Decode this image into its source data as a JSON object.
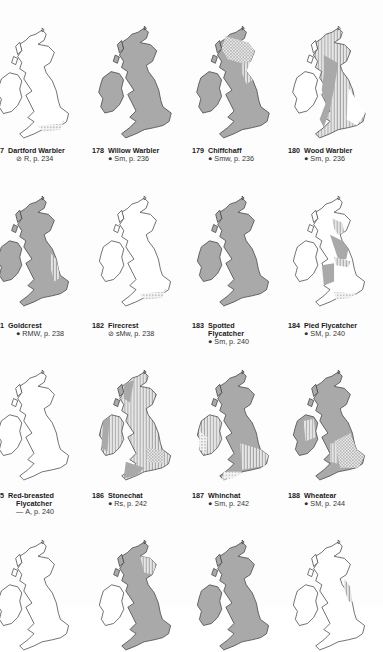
{
  "colors": {
    "land_fill": "#a9a9a9",
    "land_empty": "#ffffff",
    "coast": "#3a3a3a",
    "hatch": "#c8c8c8",
    "text": "#1a1a1a"
  },
  "species": [
    {
      "num": "7",
      "name": "Dartford Warbler",
      "name2": "",
      "symbol": "⊘",
      "status": "R, p. 234"
    },
    {
      "num": "178",
      "name": "Willow Warbler",
      "name2": "",
      "symbol": "●",
      "status": "Sm, p. 236"
    },
    {
      "num": "179",
      "name": "Chiffchaff",
      "name2": "",
      "symbol": "●",
      "status": "Smw, p. 236"
    },
    {
      "num": "180",
      "name": "Wood Warbler",
      "name2": "",
      "symbol": "●",
      "status": "Sm, p. 236"
    },
    {
      "num": "1",
      "name": "Goldcrest",
      "name2": "",
      "symbol": "●",
      "status": "RMW, p. 238"
    },
    {
      "num": "182",
      "name": "Firecrest",
      "name2": "",
      "symbol": "⊘",
      "status": "sMw, p. 238"
    },
    {
      "num": "183",
      "name": "Spotted",
      "name2": "Flycatcher",
      "symbol": "●",
      "status": "Sm, p. 240"
    },
    {
      "num": "184",
      "name": "Pied Flycatcher",
      "name2": "",
      "symbol": "●",
      "status": "SM, p. 240"
    },
    {
      "num": "5",
      "name": "Red-breasted",
      "name2": "Flycatcher",
      "symbol": "—",
      "status": "A, p. 240"
    },
    {
      "num": "186",
      "name": "Stonechat",
      "name2": "",
      "symbol": "●",
      "status": "Rs, p. 242"
    },
    {
      "num": "187",
      "name": "Whinchat",
      "name2": "",
      "symbol": "●",
      "status": "Sm, p. 242"
    },
    {
      "num": "188",
      "name": "Wheatear",
      "name2": "",
      "symbol": "●",
      "status": "SM, p. 244"
    }
  ],
  "maps": [
    {
      "id": "dartford-warbler",
      "gb": "empty",
      "ireland": "empty",
      "overlay": "south-hatch"
    },
    {
      "id": "willow-warbler",
      "gb": "full",
      "ireland": "full",
      "overlay": "none"
    },
    {
      "id": "chiffchaff",
      "gb": "full",
      "ireland": "full",
      "overlay": "north-hatch"
    },
    {
      "id": "wood-warbler",
      "gb": "partial",
      "ireland": "empty",
      "overlay": "mixed-hatch"
    },
    {
      "id": "goldcrest",
      "gb": "full",
      "ireland": "full",
      "overlay": "east-hatch"
    },
    {
      "id": "firecrest",
      "gb": "empty",
      "ireland": "empty",
      "overlay": "south-dots"
    },
    {
      "id": "spotted-flycatcher",
      "gb": "full",
      "ireland": "full",
      "overlay": "none"
    },
    {
      "id": "pied-flycatcher",
      "gb": "partial",
      "ireland": "empty",
      "overlay": "mixed-hatch"
    },
    {
      "id": "red-breasted-flycatcher",
      "gb": "empty",
      "ireland": "empty",
      "overlay": "none"
    },
    {
      "id": "stonechat",
      "gb": "partial",
      "ireland": "partial",
      "overlay": "mixed-hatch"
    },
    {
      "id": "whinchat",
      "gb": "full",
      "ireland": "hatch",
      "overlay": "south-hatch"
    },
    {
      "id": "wheatear",
      "gb": "full",
      "ireland": "partial",
      "overlay": "southeast-crosshatch"
    },
    {
      "id": "row4-map1",
      "gb": "empty",
      "ireland": "empty",
      "overlay": "none"
    },
    {
      "id": "row4-map2",
      "gb": "full",
      "ireland": "empty",
      "overlay": "north-hatch"
    },
    {
      "id": "row4-map3",
      "gb": "full",
      "ireland": "full",
      "overlay": "none"
    },
    {
      "id": "row4-map4",
      "gb": "empty",
      "ireland": "empty",
      "overlay": "east-hatch"
    }
  ]
}
